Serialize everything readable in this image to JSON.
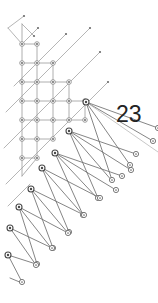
{
  "figure": {
    "type": "diagram",
    "title": "",
    "background_color": "#ffffff",
    "width": 158,
    "height": 303,
    "label": {
      "text": "23",
      "x": 116,
      "y": 103,
      "color": "#232323",
      "font_size": 23
    },
    "colors": {
      "lattice_edge": "#9a9a9a",
      "diagonal_edge": "#adadad",
      "fan_ray": "#6f6f6f",
      "fan_ray_faint": "#b9b9b9",
      "node_stroke": "#7d7d7d",
      "hub_stroke": "#4a4a4a",
      "label": "#232323"
    },
    "lattice_edges": [
      [
        22,
        24,
        22,
        44
      ],
      [
        22,
        44,
        22,
        63
      ],
      [
        22,
        63,
        22,
        82
      ],
      [
        22,
        82,
        22,
        101
      ],
      [
        22,
        101,
        22,
        120
      ],
      [
        22,
        120,
        22,
        139
      ],
      [
        22,
        139,
        22,
        158
      ],
      [
        22,
        158,
        22,
        176
      ],
      [
        37,
        44,
        37,
        63
      ],
      [
        37,
        63,
        37,
        82
      ],
      [
        37,
        82,
        37,
        101
      ],
      [
        37,
        101,
        37,
        120
      ],
      [
        37,
        120,
        37,
        139
      ],
      [
        37,
        139,
        37,
        158
      ],
      [
        53,
        63,
        53,
        82
      ],
      [
        53,
        82,
        53,
        101
      ],
      [
        53,
        101,
        53,
        120
      ],
      [
        53,
        120,
        53,
        139
      ],
      [
        69,
        82,
        69,
        101
      ],
      [
        69,
        101,
        69,
        120
      ],
      [
        85,
        101,
        85,
        120
      ],
      [
        22,
        44,
        37,
        44
      ],
      [
        22,
        63,
        37,
        63
      ],
      [
        37,
        63,
        53,
        63
      ],
      [
        22,
        82,
        37,
        82
      ],
      [
        37,
        82,
        53,
        82
      ],
      [
        53,
        82,
        69,
        82
      ],
      [
        22,
        101,
        37,
        101
      ],
      [
        37,
        101,
        53,
        101
      ],
      [
        53,
        101,
        69,
        101
      ],
      [
        69,
        101,
        85,
        101
      ],
      [
        22,
        120,
        37,
        120
      ],
      [
        37,
        120,
        53,
        120
      ],
      [
        53,
        120,
        69,
        120
      ],
      [
        69,
        120,
        85,
        120
      ],
      [
        22,
        139,
        37,
        139
      ],
      [
        37,
        139,
        53,
        139
      ],
      [
        22,
        158,
        37,
        158
      ],
      [
        22,
        176,
        37,
        158
      ]
    ],
    "diagonal_edges": [
      [
        8,
        28,
        24,
        16
      ],
      [
        8,
        28,
        22,
        44
      ],
      [
        14,
        86,
        40,
        60
      ],
      [
        40,
        60,
        66,
        34
      ],
      [
        6,
        112,
        34,
        84
      ],
      [
        34,
        84,
        62,
        56
      ],
      [
        62,
        56,
        90,
        28
      ],
      [
        4,
        148,
        36,
        116
      ],
      [
        36,
        116,
        68,
        84
      ],
      [
        68,
        84,
        100,
        52
      ],
      [
        6,
        184,
        40,
        150
      ],
      [
        40,
        150,
        74,
        116
      ],
      [
        74,
        116,
        108,
        82
      ],
      [
        8,
        206,
        30,
        184
      ],
      [
        22,
        44,
        38,
        28
      ],
      [
        22,
        24,
        34,
        36
      ]
    ],
    "fans": [
      {
        "name": "hub-1",
        "origin": [
          86,
          102
        ],
        "rays": [
          {
            "to": [
              158,
              128
            ],
            "faint": false
          },
          {
            "to": [
              153,
              141
            ],
            "faint": false
          },
          {
            "to": [
              158,
              152
            ],
            "faint": true
          },
          {
            "to": [
              130,
              165
            ],
            "faint": false
          },
          {
            "to": [
              112,
              180
            ],
            "faint": false
          }
        ]
      },
      {
        "name": "hub-2",
        "origin": [
          69,
          131
        ],
        "rays": [
          {
            "to": [
              136,
              154
            ],
            "faint": false
          },
          {
            "to": [
              131,
              170
            ],
            "faint": false
          },
          {
            "to": [
              113,
              182
            ],
            "faint": false
          },
          {
            "to": [
              98,
              198
            ],
            "faint": false
          }
        ]
      },
      {
        "name": "hub-3",
        "origin": [
          55,
          153
        ],
        "rays": [
          {
            "to": [
              122,
              176
            ],
            "faint": false
          },
          {
            "to": [
              116,
              190
            ],
            "faint": false
          },
          {
            "to": [
              99,
              200
            ],
            "faint": false
          },
          {
            "to": [
              83,
              215
            ],
            "faint": false
          }
        ]
      },
      {
        "name": "hub-4",
        "origin": [
          42,
          168
        ],
        "rays": [
          {
            "to": [
              100,
              198
            ],
            "faint": false
          },
          {
            "to": [
              84,
              216
            ],
            "faint": false
          },
          {
            "to": [
              69,
              232
            ],
            "faint": false
          }
        ]
      },
      {
        "name": "hub-5",
        "origin": [
          31,
          189
        ],
        "rays": [
          {
            "to": [
              84,
              215
            ],
            "faint": false
          },
          {
            "to": [
              68,
              233
            ],
            "faint": false
          },
          {
            "to": [
              53,
              248
            ],
            "faint": false
          }
        ]
      },
      {
        "name": "hub-6",
        "origin": [
          19,
          207
        ],
        "rays": [
          {
            "to": [
              68,
              233
            ],
            "faint": false
          },
          {
            "to": [
              52,
              249
            ],
            "faint": false
          },
          {
            "to": [
              37,
              264
            ],
            "faint": false
          }
        ]
      },
      {
        "name": "hub-7",
        "origin": [
          10,
          228
        ],
        "rays": [
          {
            "to": [
              52,
              248
            ],
            "faint": false
          },
          {
            "to": [
              36,
              265
            ],
            "faint": false
          }
        ]
      },
      {
        "name": "hub-8",
        "origin": [
          8,
          255
        ],
        "rays": [
          {
            "to": [
              36,
              264
            ],
            "faint": false
          },
          {
            "to": [
              22,
              282
            ],
            "faint": false
          }
        ]
      },
      {
        "name": "hub-9",
        "origin": [
          10,
          278
        ],
        "rays": [
          {
            "to": [
              22,
              283
            ],
            "faint": false
          }
        ]
      }
    ],
    "lattice_nodes": [
      [
        22,
        44
      ],
      [
        22,
        63
      ],
      [
        22,
        82
      ],
      [
        22,
        101
      ],
      [
        22,
        120
      ],
      [
        22,
        139
      ],
      [
        22,
        158
      ],
      [
        37,
        44
      ],
      [
        37,
        63
      ],
      [
        37,
        82
      ],
      [
        37,
        101
      ],
      [
        37,
        120
      ],
      [
        37,
        139
      ],
      [
        37,
        158
      ],
      [
        53,
        63
      ],
      [
        53,
        82
      ],
      [
        53,
        101
      ],
      [
        53,
        120
      ],
      [
        53,
        139
      ],
      [
        69,
        82
      ],
      [
        69,
        101
      ],
      [
        69,
        120
      ],
      [
        85,
        101
      ],
      [
        85,
        120
      ]
    ],
    "small_markers": [
      [
        24,
        16
      ],
      [
        38,
        28
      ],
      [
        66,
        34
      ],
      [
        90,
        28
      ],
      [
        100,
        52
      ],
      [
        108,
        82
      ],
      [
        34,
        36
      ]
    ],
    "tip_nodes": [
      [
        158,
        128
      ],
      [
        153,
        141
      ],
      [
        130,
        165
      ],
      [
        112,
        180
      ],
      [
        136,
        154
      ],
      [
        131,
        170
      ],
      [
        98,
        198
      ],
      [
        122,
        176
      ],
      [
        116,
        190
      ],
      [
        83,
        215
      ],
      [
        100,
        198
      ],
      [
        69,
        232
      ],
      [
        84,
        215
      ],
      [
        53,
        248
      ],
      [
        68,
        233
      ],
      [
        37,
        264
      ],
      [
        52,
        248
      ],
      [
        36,
        265
      ],
      [
        22,
        282
      ]
    ],
    "hub_nodes": [
      [
        86,
        102
      ],
      [
        69,
        131
      ],
      [
        55,
        153
      ],
      [
        42,
        168
      ],
      [
        31,
        189
      ],
      [
        19,
        207
      ],
      [
        10,
        228
      ],
      [
        8,
        255
      ]
    ]
  }
}
